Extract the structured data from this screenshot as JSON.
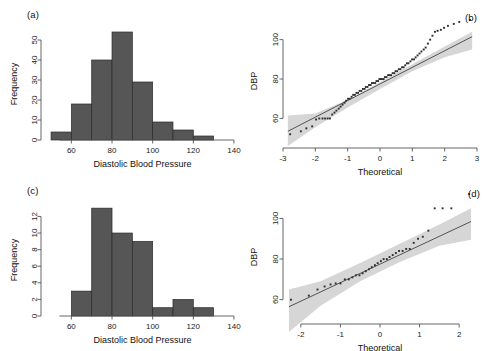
{
  "figure": {
    "panels": [
      {
        "tag": "(a)",
        "type": "histogram"
      },
      {
        "tag": "(b)",
        "type": "qq"
      },
      {
        "tag": "(c)",
        "type": "histogram"
      },
      {
        "tag": "(d)",
        "type": "qq"
      }
    ],
    "colors": {
      "bar_fill": "#565656",
      "bar_border": "#2b2b2b",
      "band_fill": "#d6d6d6",
      "line": "#3a3a3a",
      "point": "#2e2e2e",
      "axis": "#555555",
      "background": "#ffffff"
    }
  },
  "chart_data": [
    {
      "type": "bar",
      "panel": "(a)",
      "title": "",
      "xlabel": "Diastolic Blood Pressure",
      "ylabel": "Frequency",
      "xlim": [
        48,
        142
      ],
      "ylim": [
        0,
        56
      ],
      "xticks": [
        60,
        80,
        100,
        120,
        140
      ],
      "yticks": [
        0,
        10,
        20,
        30,
        40,
        50
      ],
      "grid": false,
      "bin_width": 10,
      "bin_edges": [
        50,
        60,
        70,
        80,
        90,
        100,
        110,
        120
      ],
      "categories": [
        "50-60",
        "60-70",
        "70-80",
        "80-90",
        "90-100",
        "100-110",
        "110-120"
      ],
      "values": [
        4,
        18,
        40,
        54,
        29,
        9,
        5
      ],
      "extra_bins": [
        {
          "range": "120-130",
          "value": 2
        }
      ]
    },
    {
      "type": "scatter",
      "panel": "(b)",
      "title": "",
      "xlabel": "Theoretical",
      "ylabel": "DBP",
      "xlim": [
        -3,
        3
      ],
      "ylim": [
        45,
        113
      ],
      "xticks": [
        -3,
        -2,
        -1,
        0,
        1,
        2,
        3
      ],
      "yticks": [
        60,
        80,
        100
      ],
      "grid": false,
      "has_reference_line": true,
      "has_confidence_band": true,
      "reference_line": {
        "x": [
          -2.85,
          2.85
        ],
        "y": [
          53.5,
          101.5
        ]
      },
      "band_upper": {
        "x": [
          -2.85,
          -2.0,
          -1.0,
          0.0,
          1.0,
          2.0,
          2.85
        ],
        "y": [
          61.5,
          62.5,
          69.5,
          78.5,
          87.5,
          96.5,
          104.0
        ]
      },
      "band_lower": {
        "x": [
          -2.85,
          -2.0,
          -1.0,
          0.0,
          1.0,
          2.0,
          2.85
        ],
        "y": [
          46.0,
          55.5,
          65.5,
          75.0,
          84.0,
          91.0,
          95.0
        ]
      },
      "x": [
        -2.78,
        -2.45,
        -2.28,
        -2.1,
        -1.98,
        -1.88,
        -1.78,
        -1.7,
        -1.62,
        -1.55,
        -1.48,
        -1.41,
        -1.35,
        -1.28,
        -1.22,
        -1.16,
        -1.1,
        -1.05,
        -0.99,
        -0.94,
        -0.88,
        -0.83,
        -0.78,
        -0.73,
        -0.68,
        -0.63,
        -0.58,
        -0.53,
        -0.48,
        -0.44,
        -0.39,
        -0.34,
        -0.29,
        -0.25,
        -0.2,
        -0.15,
        -0.11,
        -0.06,
        -0.02,
        0.02,
        0.06,
        0.11,
        0.15,
        0.2,
        0.25,
        0.29,
        0.34,
        0.39,
        0.44,
        0.48,
        0.53,
        0.58,
        0.63,
        0.68,
        0.73,
        0.78,
        0.83,
        0.88,
        0.94,
        0.99,
        1.05,
        1.1,
        1.16,
        1.22,
        1.28,
        1.35,
        1.41,
        1.48,
        1.55,
        1.62,
        1.7,
        1.78,
        1.88,
        1.98,
        2.1,
        2.28,
        2.45,
        2.78
      ],
      "y": [
        52.0,
        53.5,
        55.0,
        56.0,
        59.5,
        60.0,
        60.0,
        60.0,
        60.0,
        60.0,
        62.0,
        63.0,
        64.0,
        65.0,
        66.0,
        67.0,
        68.0,
        69.0,
        70.0,
        70.0,
        71.0,
        72.0,
        72.0,
        73.0,
        73.0,
        74.0,
        74.0,
        75.0,
        75.0,
        76.0,
        76.0,
        77.0,
        77.0,
        78.0,
        78.0,
        78.0,
        79.0,
        79.0,
        80.0,
        80.0,
        80.0,
        80.0,
        81.0,
        81.0,
        82.0,
        82.0,
        82.0,
        83.0,
        83.0,
        84.0,
        84.0,
        85.0,
        85.0,
        86.0,
        86.0,
        87.0,
        88.0,
        88.0,
        89.0,
        90.0,
        90.0,
        91.0,
        92.0,
        93.0,
        94.0,
        95.0,
        96.0,
        98.0,
        100.0,
        102.0,
        104.0,
        104.5,
        105.0,
        106.0,
        107.0,
        108.0,
        109.0,
        110.0
      ]
    },
    {
      "type": "bar",
      "panel": "(c)",
      "title": "",
      "xlabel": "Diastolic Blood Pressure",
      "ylabel": "Frequency",
      "xlim": [
        48,
        142
      ],
      "ylim": [
        0,
        13.5
      ],
      "xticks": [
        60,
        80,
        100,
        120,
        140
      ],
      "yticks": [
        0,
        2,
        4,
        6,
        8,
        10,
        12
      ],
      "grid": false,
      "bin_width": 10,
      "bin_edges": [
        60,
        70,
        80,
        90,
        100,
        110,
        120
      ],
      "categories": [
        "60-70",
        "70-80",
        "80-90",
        "90-100",
        "100-110",
        "110-120"
      ],
      "values": [
        3,
        13,
        10,
        9,
        1,
        2
      ],
      "extra_bins": [
        {
          "range": "120-130",
          "value": 1
        }
      ]
    },
    {
      "type": "scatter",
      "panel": "(d)",
      "title": "",
      "xlabel": "Theoretical",
      "ylabel": "DBP",
      "xlim": [
        -2.45,
        2.45
      ],
      "ylim": [
        48,
        114
      ],
      "xticks": [
        -2,
        -1,
        0,
        1,
        2
      ],
      "yticks": [
        60,
        80,
        100
      ],
      "grid": false,
      "has_reference_line": true,
      "has_confidence_band": true,
      "reference_line": {
        "x": [
          -2.3,
          2.3
        ],
        "y": [
          56.5,
          98.5
        ]
      },
      "band_upper": {
        "x": [
          -2.3,
          -1.5,
          -0.5,
          0.5,
          1.5,
          2.3
        ],
        "y": [
          65.0,
          69.0,
          78.0,
          87.5,
          97.0,
          105.0
        ]
      },
      "band_lower": {
        "x": [
          -2.3,
          -1.5,
          -0.5,
          0.5,
          1.5,
          2.3
        ],
        "y": [
          44.0,
          57.0,
          69.0,
          78.5,
          86.5,
          89.5
        ]
      },
      "x": [
        -2.25,
        -1.8,
        -1.58,
        -1.4,
        -1.25,
        -1.12,
        -1.0,
        -0.89,
        -0.79,
        -0.7,
        -0.61,
        -0.52,
        -0.44,
        -0.36,
        -0.28,
        -0.21,
        -0.13,
        -0.06,
        0.02,
        0.09,
        0.17,
        0.24,
        0.32,
        0.4,
        0.48,
        0.57,
        0.66,
        0.75,
        0.85,
        0.96,
        1.08,
        1.22,
        1.38,
        1.58,
        1.8,
        2.25
      ],
      "y": [
        60.0,
        62.0,
        65.0,
        66.5,
        67.5,
        68.0,
        68.0,
        70.0,
        70.0,
        71.0,
        72.0,
        72.0,
        73.0,
        74.0,
        75.0,
        76.0,
        77.0,
        78.0,
        79.0,
        80.0,
        80.0,
        81.0,
        82.0,
        83.0,
        84.0,
        84.0,
        85.0,
        85.0,
        88.0,
        90.0,
        91.0,
        94.0,
        105.0,
        105.0,
        105.0,
        112.0
      ]
    }
  ]
}
